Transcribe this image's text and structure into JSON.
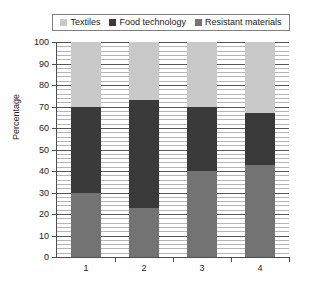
{
  "chart_data": {
    "type": "bar",
    "title": "",
    "subtitle": "",
    "xlabel": "",
    "ylabel": "Percentage",
    "ylim": [
      0,
      100
    ],
    "ytick_step": 10,
    "yticks": [
      0,
      10,
      20,
      30,
      40,
      50,
      60,
      70,
      80,
      90,
      100
    ],
    "ytick_labels": [
      "0",
      "10",
      "20",
      "30",
      "40",
      "50",
      "60",
      "70",
      "80",
      "90",
      "100"
    ],
    "categories": [
      "1",
      "2",
      "3",
      "4"
    ],
    "stacked": true,
    "stack_total": 100,
    "grid": true,
    "grid_orientation": "horizontal",
    "grid_minor": true,
    "legend_position": "top",
    "series": [
      {
        "name": "Textiles",
        "color": "#c9c9c9",
        "values": [
          30,
          27,
          30,
          33
        ]
      },
      {
        "name": "Food technology",
        "color": "#3a3a3a",
        "values": [
          40,
          50,
          30,
          24
        ]
      },
      {
        "name": "Resistant materials",
        "color": "#737373",
        "values": [
          30,
          23,
          40,
          43
        ]
      }
    ],
    "stack_order_bottom_to_top": [
      "Resistant materials",
      "Food technology",
      "Textiles"
    ],
    "annotations": []
  },
  "legend": {
    "entries": [
      {
        "label": "Textiles",
        "color": "#c9c9c9"
      },
      {
        "label": "Food technology",
        "color": "#3a3a3a"
      },
      {
        "label": "Resistant materials",
        "color": "#737373"
      }
    ]
  },
  "axes": {
    "y_title": "Percentage"
  }
}
